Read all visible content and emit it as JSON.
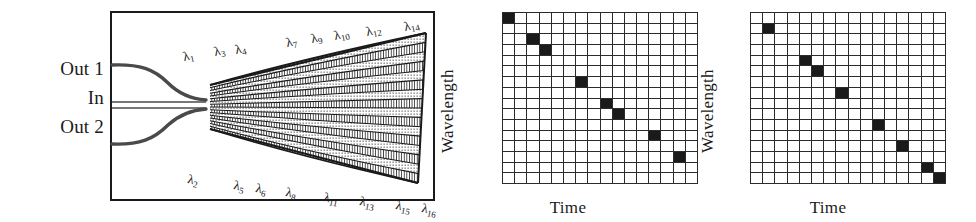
{
  "figure": {
    "caption_domain": "optical waveguide grating router with time-wavelength mapping grids"
  },
  "device_panel": {
    "name": "waveguide-grating-router",
    "ports": [
      {
        "id": "out1",
        "label": "Out 1"
      },
      {
        "id": "in",
        "label": "In"
      },
      {
        "id": "out2",
        "label": "Out 2"
      }
    ],
    "top_labels": [
      {
        "base": "λ",
        "sub": "1",
        "x": 75,
        "y": 38,
        "rot": -13
      },
      {
        "base": "λ",
        "sub": "3",
        "x": 106,
        "y": 33,
        "rot": -13
      },
      {
        "base": "λ",
        "sub": "4",
        "x": 127,
        "y": 31,
        "rot": -13
      },
      {
        "base": "λ",
        "sub": "7",
        "x": 178,
        "y": 24,
        "rot": -13
      },
      {
        "base": "λ",
        "sub": "9",
        "x": 203,
        "y": 20,
        "rot": -13
      },
      {
        "base": "λ",
        "sub": "10",
        "x": 226,
        "y": 17,
        "rot": -13
      },
      {
        "base": "λ",
        "sub": "12",
        "x": 258,
        "y": 13,
        "rot": -13
      },
      {
        "base": "λ",
        "sub": "14",
        "x": 296,
        "y": 8,
        "rot": -13
      }
    ],
    "bottom_labels": [
      {
        "base": "λ",
        "sub": "2",
        "x": 76,
        "y": 160,
        "rot": 12
      },
      {
        "base": "λ",
        "sub": "5",
        "x": 122,
        "y": 166,
        "rot": 12
      },
      {
        "base": "λ",
        "sub": "6",
        "x": 144,
        "y": 169,
        "rot": 12
      },
      {
        "base": "λ",
        "sub": "8",
        "x": 174,
        "y": 173,
        "rot": 12
      },
      {
        "base": "λ",
        "sub": "11",
        "x": 212,
        "y": 178,
        "rot": 12
      },
      {
        "base": "λ",
        "sub": "13",
        "x": 248,
        "y": 182,
        "rot": 12
      },
      {
        "base": "λ",
        "sub": "15",
        "x": 284,
        "y": 186,
        "rot": 12
      },
      {
        "base": "λ",
        "sub": "16",
        "x": 310,
        "y": 189,
        "rot": 12
      }
    ],
    "arm_count": 16,
    "colors": {
      "ink": "#1a1a1a",
      "paper": "#ffffff"
    }
  },
  "grids": [
    {
      "name": "grid-left",
      "x_axis_label": "Time",
      "y_axis_label": "Wavelength",
      "cols": 16,
      "rows": 16,
      "filled_cells": [
        {
          "col": 0,
          "row": 0
        },
        {
          "col": 2,
          "row": 2
        },
        {
          "col": 3,
          "row": 3
        },
        {
          "col": 6,
          "row": 6
        },
        {
          "col": 8,
          "row": 8
        },
        {
          "col": 9,
          "row": 9
        },
        {
          "col": 12,
          "row": 11
        },
        {
          "col": 14,
          "row": 13
        }
      ]
    },
    {
      "name": "grid-right",
      "x_axis_label": "Time",
      "y_axis_label": "Wavelength",
      "cols": 16,
      "rows": 16,
      "filled_cells": [
        {
          "col": 1,
          "row": 1
        },
        {
          "col": 4,
          "row": 4
        },
        {
          "col": 5,
          "row": 5
        },
        {
          "col": 7,
          "row": 7
        },
        {
          "col": 10,
          "row": 10
        },
        {
          "col": 12,
          "row": 12
        },
        {
          "col": 14,
          "row": 14
        },
        {
          "col": 15,
          "row": 15
        }
      ]
    }
  ],
  "chart_data": {
    "type": "heatmap",
    "title": "",
    "xlabel": "Time",
    "ylabel": "Wavelength",
    "grid": true,
    "legend": "none",
    "panels": [
      {
        "name": "grid-left",
        "cols": 16,
        "rows": 16,
        "points": [
          [
            0,
            0
          ],
          [
            2,
            2
          ],
          [
            3,
            3
          ],
          [
            6,
            6
          ],
          [
            8,
            8
          ],
          [
            9,
            9
          ],
          [
            12,
            11
          ],
          [
            14,
            13
          ]
        ]
      },
      {
        "name": "grid-right",
        "cols": 16,
        "rows": 16,
        "points": [
          [
            1,
            1
          ],
          [
            4,
            4
          ],
          [
            5,
            5
          ],
          [
            7,
            7
          ],
          [
            10,
            10
          ],
          [
            12,
            12
          ],
          [
            14,
            14
          ],
          [
            15,
            15
          ]
        ]
      }
    ]
  }
}
